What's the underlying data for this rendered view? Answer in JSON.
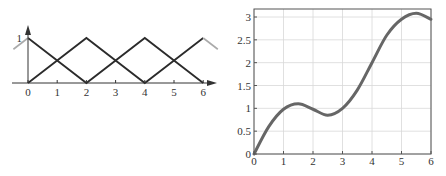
{
  "chart_data": [
    {
      "type": "line",
      "title": "",
      "xlabel": "",
      "ylabel": "",
      "x_ticks": [
        "0",
        "1",
        "2",
        "3",
        "4",
        "5",
        "6"
      ],
      "y_ticks": [
        "1"
      ],
      "xlim": [
        -0.6,
        6.6
      ],
      "ylim": [
        0,
        1.15
      ],
      "grid": false,
      "axes_style": "arrows",
      "series": [
        {
          "name": "hat-A",
          "x": [
            0,
            2,
            4,
            6
          ],
          "y": [
            1,
            0,
            1,
            0
          ],
          "color": "#2b2b2b"
        },
        {
          "name": "hat-B",
          "x": [
            0,
            2,
            4,
            6
          ],
          "y": [
            0,
            1,
            0,
            1
          ],
          "color": "#2b2b2b"
        },
        {
          "name": "hat-B-continuation",
          "x": [
            6,
            6.5
          ],
          "y": [
            1,
            0.75
          ],
          "color": "#aaaaaa"
        },
        {
          "name": "hat-A-left-continuation",
          "x": [
            -0.5,
            0
          ],
          "y": [
            0.75,
            1
          ],
          "color": "#aaaaaa"
        }
      ],
      "colors": {
        "line": "#2b2b2b",
        "continuation": "#aaaaaa",
        "axis": "#333333"
      }
    },
    {
      "type": "line",
      "title": "",
      "xlabel": "",
      "ylabel": "",
      "x_ticks": [
        "0",
        "1",
        "2",
        "3",
        "4",
        "5",
        "6"
      ],
      "y_ticks": [
        "0",
        "0.5",
        "1",
        "1.5",
        "2",
        "2.5",
        "3"
      ],
      "xlim": [
        0,
        6
      ],
      "ylim": [
        0,
        3.2
      ],
      "grid": true,
      "series": [
        {
          "name": "curve",
          "x": [
            0,
            0.5,
            1,
            1.5,
            2,
            2.5,
            3,
            3.5,
            4,
            4.5,
            5,
            5.5,
            6
          ],
          "y": [
            0,
            0.6,
            0.98,
            1.1,
            0.98,
            0.85,
            1.0,
            1.4,
            2.0,
            2.6,
            2.95,
            3.08,
            2.95
          ]
        }
      ],
      "colors": {
        "line": "#666666",
        "grid": "#d8d8d8",
        "frame": "#555555"
      }
    }
  ]
}
